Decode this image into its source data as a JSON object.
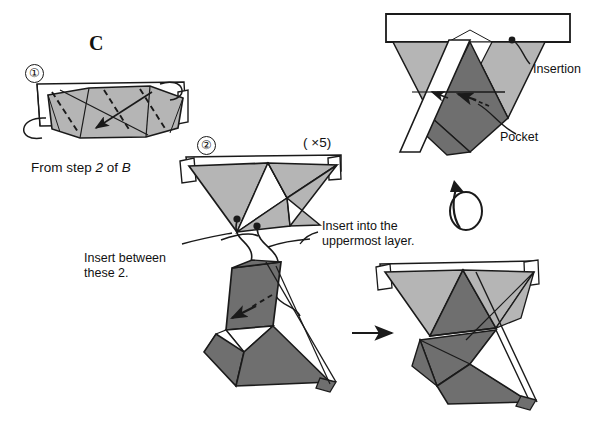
{
  "document": {
    "kind": "origami-assembly-diagram",
    "section_letter": "C"
  },
  "labels": {
    "step1_number": "①",
    "step2_number": "②",
    "from_step_prefix": "From step ",
    "from_step_num": "2",
    "from_step_mid": " of ",
    "from_step_unit": "B",
    "from_step_full": "From step 2 of B",
    "multiplier": "( ×5)",
    "insert_between": "Insert between\nthese 2.",
    "insert_between_line1": "Insert between",
    "insert_between_line2": "these 2.",
    "insert_uppermost": "Insert into the\nuppermost layer.",
    "insert_uppermost_line1": "Insert into the",
    "insert_uppermost_line2": "uppermost layer.",
    "insertion": "Insertion",
    "pocket": "Pocket"
  },
  "icons": {
    "step1_marker": "circled-number-1-icon",
    "step2_marker": "circled-number-2-icon",
    "rotate_arrow": "rotate-loop-arrow-icon",
    "transition_arrow": "right-arrow-icon",
    "fold_arrow_step1": "fold-direction-arrow-icon",
    "tuck_arrow": "tuck-arrow-icon",
    "insertion_leader": "leader-line-icon",
    "pocket_leader": "leader-line-icon"
  },
  "colors": {
    "paper_light": "#b5b5b5",
    "paper_mid": "#9a9a9a",
    "paper_dark": "#6f6f6f",
    "paper_white": "#ffffff",
    "ink": "#1a1a1a",
    "background": "#ffffff"
  },
  "figures": [
    {
      "id": "step1-module",
      "name": "flattened-unit-top-view",
      "step": "①",
      "caption": "From step 2 of B"
    },
    {
      "id": "step2-module",
      "name": "opened-unit",
      "step": "②",
      "note": "( ×5)"
    },
    {
      "id": "detail-module",
      "name": "insertion-pocket-detail",
      "callouts": [
        "Insertion",
        "Pocket"
      ]
    },
    {
      "id": "joining-module",
      "name": "two-units-joined-before"
    },
    {
      "id": "result-module",
      "name": "two-units-joined-after"
    }
  ]
}
